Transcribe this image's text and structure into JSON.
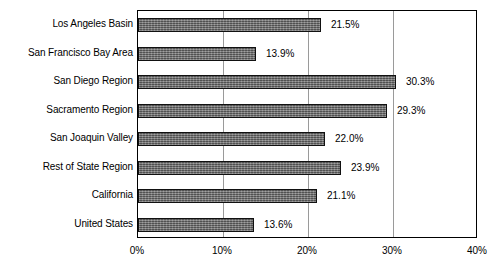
{
  "chart_data": {
    "type": "bar",
    "orientation": "horizontal",
    "title": "",
    "xlabel": "",
    "ylabel": "",
    "categories": [
      "Los Angeles Basin",
      "San Francisco Bay Area",
      "San Diego Region",
      "Sacramento Region",
      "San Joaquin Valley",
      "Rest of State Region",
      "California",
      "United States"
    ],
    "values": [
      21.5,
      13.9,
      30.3,
      29.3,
      22.0,
      23.9,
      21.1,
      13.6
    ],
    "value_labels": [
      "21.5%",
      "13.9%",
      "30.3%",
      "29.3%",
      "22.0%",
      "23.9%",
      "21.1%",
      "13.6%"
    ],
    "xlim": [
      0,
      40
    ],
    "xticks": [
      0,
      10,
      20,
      30,
      40
    ],
    "xtick_labels": [
      "0%",
      "10%",
      "20%",
      "30%",
      "40%"
    ],
    "grid": true,
    "legend": false,
    "bar_color": "#6e6e6e",
    "bar_border_color": "#111111",
    "gridline_color": "#9a9a9a",
    "axis_color": "#000000",
    "background": "#ffffff"
  }
}
